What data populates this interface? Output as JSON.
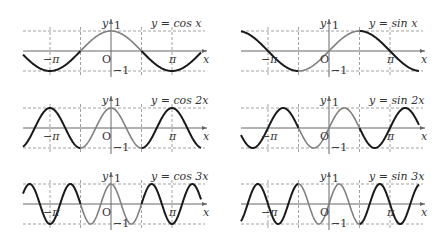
{
  "panels": [
    {
      "id": "cos1",
      "title": "y = cos x",
      "func": "cos",
      "k": 1,
      "ox": 111,
      "oy": 51
    },
    {
      "id": "sin1",
      "title": "y = sin x",
      "func": "sin",
      "k": 1,
      "ox": 329,
      "oy": 51
    },
    {
      "id": "cos2",
      "title": "y = cos 2x",
      "func": "cos",
      "k": 2,
      "ox": 111,
      "oy": 128
    },
    {
      "id": "sin2",
      "title": "y = sin 2x",
      "func": "sin",
      "k": 2,
      "ox": 329,
      "oy": 128
    },
    {
      "id": "cos3",
      "title": "y = cos 3x",
      "func": "cos",
      "k": 3,
      "ox": 111,
      "oy": 204
    },
    {
      "id": "sin3",
      "title": "y = sin 3x",
      "func": "sin",
      "k": 3,
      "ox": 329,
      "oy": 204
    }
  ],
  "labels": {
    "y_axis": "y",
    "x_axis": "x",
    "origin": "O",
    "one": "1",
    "minus_one": "−1",
    "pi": "π",
    "minus_pi": "−π"
  },
  "geometry": {
    "pi_px": 61,
    "amp_px": 20,
    "x_left": -88,
    "x_right": 90
  },
  "colors": {
    "outer_curve": "#1a1a1a",
    "inner_curve": "#808080",
    "grid": "#8a8a8a"
  }
}
